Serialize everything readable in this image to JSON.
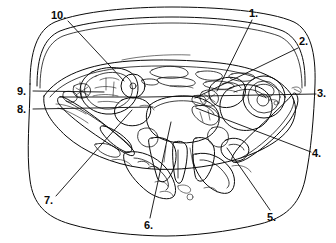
{
  "figure": {
    "background_color": "#ffffff",
    "ink_color": "#0a0a0a",
    "width": 336,
    "height": 243
  },
  "labels": [
    {
      "id": "1",
      "text": "1.",
      "x": 249,
      "y": 7,
      "anchor_x": 252,
      "anchor_y": 20,
      "target_x": 216,
      "target_y": 90
    },
    {
      "id": "2",
      "text": "2.",
      "x": 299,
      "y": 35,
      "anchor_x": 298,
      "anchor_y": 48,
      "target_x": 196,
      "target_y": 98
    },
    {
      "id": "3",
      "text": "3.",
      "x": 317,
      "y": 87,
      "anchor_x": 316,
      "anchor_y": 94,
      "target_x": 150,
      "target_y": 97
    },
    {
      "id": "4",
      "text": "4.",
      "x": 312,
      "y": 147,
      "anchor_x": 311,
      "anchor_y": 152,
      "target_x": 196,
      "target_y": 108
    },
    {
      "id": "5",
      "text": "5.",
      "x": 267,
      "y": 211,
      "anchor_x": 270,
      "anchor_y": 210,
      "target_x": 227,
      "target_y": 148
    },
    {
      "id": "6",
      "text": "6.",
      "x": 144,
      "y": 219,
      "anchor_x": 150,
      "anchor_y": 218,
      "target_x": 172,
      "target_y": 123
    },
    {
      "id": "7",
      "text": "7.",
      "x": 44,
      "y": 194,
      "anchor_x": 56,
      "anchor_y": 196,
      "target_x": 132,
      "target_y": 110
    },
    {
      "id": "8",
      "text": "8.",
      "x": 17,
      "y": 103,
      "anchor_x": 33,
      "anchor_y": 109,
      "target_x": 152,
      "target_y": 107
    },
    {
      "id": "9",
      "text": "9.",
      "x": 17,
      "y": 85,
      "anchor_x": 33,
      "anchor_y": 91,
      "target_x": 104,
      "target_y": 92
    },
    {
      "id": "10",
      "text": "10.",
      "x": 51,
      "y": 9,
      "anchor_x": 68,
      "anchor_y": 21,
      "target_x": 124,
      "target_y": 81
    }
  ],
  "leader_paths": {
    "1": "M252,20 L217,91",
    "2": "M298,48 L195,98",
    "3": "M316,94 L147,97 L60,97",
    "4": "M311,152 L196,108",
    "5": "M270,210 L227,148",
    "6": "M150,218 L171,122",
    "7": "M56,196 L132,110",
    "8": "M33,109 L153,107",
    "9": "M33,91 L104,92",
    "10": "M68,21 L124,81"
  },
  "outlines": {
    "outer_body": "M28,78 C28,46 34,28 52,20 C78,10 130,6 170,6 C214,6 268,10 292,20 C308,27 314,46 314,78 C314,112 312,150 306,178 C300,204 286,216 262,222 C230,230 190,234 166,234 C138,234 96,230 70,222 C46,215 34,202 30,178 C26,152 28,110 28,78 Z",
    "subcutaneous_inner": "M36,80 C36,52 42,36 58,29 C84,19 132,16 170,16 C210,16 256,19 282,29 C298,36 305,52 305,80 C305,112 302,148 297,172 C292,195 280,206 258,212 C228,220 190,224 166,224 C140,224 100,220 76,212 C54,205 43,194 39,172 C34,148 36,108 36,80 Z"
  },
  "icon_names": {
    "leader_line": "leader-line",
    "anatomy_drawing": "anatomy-line-drawing"
  }
}
